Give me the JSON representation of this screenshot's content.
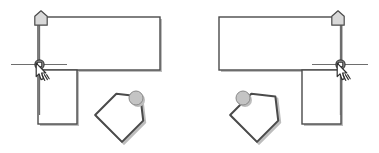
{
  "figure": {
    "background_color": "#ffffff",
    "width": 379,
    "height": 153,
    "panel_count": 2
  },
  "style": {
    "outline_color": "#4a4a4a",
    "outline_color_dark": "#3c3c3c",
    "shadow_color": "#bdbdbd",
    "fill_white": "#ffffff",
    "fill_light_gray": "#d9d9d9",
    "fill_mid_gray": "#c4c4c4",
    "guide_line_color": "#6e6e6e",
    "cursor_fill": "#ffffff",
    "cursor_outline": "#2f2f2f",
    "stroke_width": "1.4",
    "shadow_offset": "2"
  },
  "panels": [
    {
      "id": "panel-left",
      "label": "Left panel",
      "mirrored": false,
      "elements": {
        "horizontal_rectangle": {
          "name": "wide upper rectangle",
          "x": 38,
          "y": 17,
          "width": 122,
          "height": 53
        },
        "vertical_rectangle": {
          "name": "narrow lower rectangle",
          "x": 38,
          "y": 70,
          "width": 39,
          "height": 54
        },
        "guide_line": {
          "name": "vertical alignment guide",
          "x": 39,
          "y_top": 18,
          "y_bottom": 115
        },
        "grip_handle": {
          "name": "pentagon grip handle",
          "cx": 41,
          "cy": 18,
          "size": 13
        },
        "snap_node": {
          "name": "snap anchor node",
          "cx": 39,
          "cy": 64,
          "radius": 4,
          "crosshair_half_width": 28,
          "crosshair_right_extent": 42
        },
        "cursor": {
          "name": "pointing hand cursor",
          "x": 36,
          "y": 62
        },
        "rotated_pentagon": {
          "name": "rotated pentagon object",
          "cx": 122,
          "cy": 115,
          "size": 27,
          "rotation_deg": 45,
          "ball": {
            "name": "drag ball",
            "cx": 136,
            "cy": 98,
            "radius": 7
          }
        }
      }
    },
    {
      "id": "panel-right",
      "label": "Right panel",
      "mirrored": true,
      "elements": {
        "horizontal_rectangle": {
          "name": "wide upper rectangle",
          "x": 219,
          "y": 17,
          "width": 122,
          "height": 53
        },
        "vertical_rectangle": {
          "name": "narrow lower rectangle",
          "x": 302,
          "y": 70,
          "width": 39,
          "height": 54
        },
        "guide_line": {
          "name": "vertical alignment guide",
          "x": 340,
          "y_top": 18,
          "y_bottom": 115
        },
        "grip_handle": {
          "name": "pentagon grip handle",
          "cx": 338,
          "cy": 18,
          "size": 13
        },
        "snap_node": {
          "name": "snap anchor node",
          "cx": 340,
          "cy": 64,
          "radius": 4,
          "crosshair_half_width": 28,
          "crosshair_right_extent": 42
        },
        "cursor": {
          "name": "pointing hand cursor",
          "x": 337,
          "y": 62
        },
        "rotated_pentagon": {
          "name": "rotated pentagon object",
          "cx": 257,
          "cy": 115,
          "size": 27,
          "rotation_deg": 45,
          "ball": {
            "name": "drag ball",
            "cx": 243,
            "cy": 98,
            "radius": 7
          }
        }
      }
    }
  ],
  "captions": {
    "left": "",
    "right": ""
  }
}
